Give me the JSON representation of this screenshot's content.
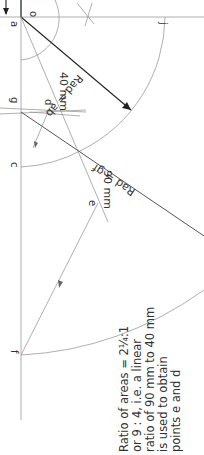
{
  "diagram": {
    "orientation": "rotated 90deg clockwise",
    "points": {
      "o": "o",
      "a": "a",
      "j": "j",
      "g": "g",
      "d": "d",
      "c": "c",
      "e": "e",
      "f": "f"
    },
    "dimensions": {
      "d40": "40 mm",
      "d90": "90 mm"
    },
    "radii": {
      "rad_ab": "Rad = ab",
      "rad_gf": "Rad = gf"
    },
    "note": {
      "line1": "Ratio of areas = 2¼:1",
      "line2": "or 9 : 4, i.e. a linear",
      "line3": "ratio of 90 mm to 40 mm",
      "line4": "is used to obtain",
      "line5": "points e and d"
    },
    "colors": {
      "line": "#9a9a9a",
      "dark_line": "#222222",
      "text": "#333333"
    }
  }
}
